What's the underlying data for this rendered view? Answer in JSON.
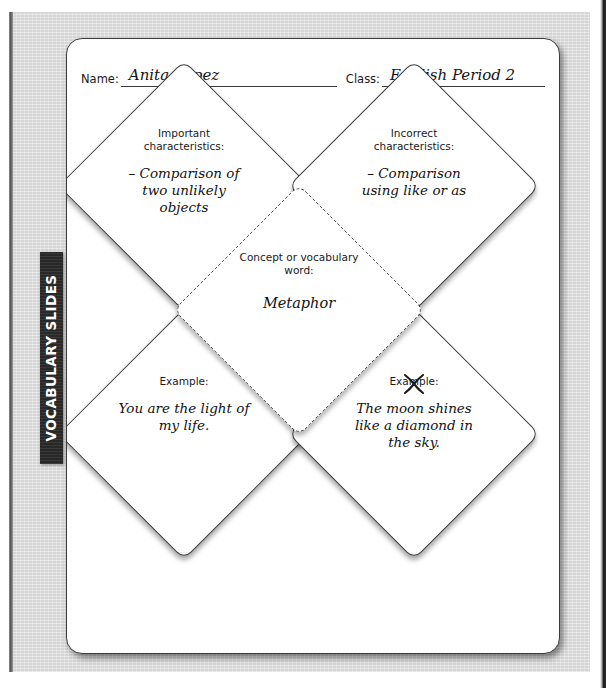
{
  "sidebar": {
    "tab_label": "VOCABULARY SLIDES"
  },
  "header": {
    "name_label": "Name:",
    "name_value": "Anita Lopez",
    "class_label": "Class:",
    "class_value": "English Period 2"
  },
  "diamonds": {
    "top_left": {
      "title": "Important characteristics:",
      "body": "– Comparison of two unlikely objects"
    },
    "top_right": {
      "title": "Incorrect characteristics:",
      "body": "– Comparison using like or as"
    },
    "center": {
      "title": "Concept or vocabulary word:",
      "body": "Metaphor"
    },
    "bottom_left": {
      "title": "Example:",
      "body": "You are the light of my life."
    },
    "bottom_right": {
      "title": "Example:",
      "body": "The moon shines like a diamond in the sky.",
      "marked_out": true
    }
  },
  "colors": {
    "tab_background": "#2e2e2e",
    "tab_text": "#ffffff",
    "page_background": "#dcdcdc",
    "card_background": "#ffffff",
    "ink": "#121212",
    "outline": "#3d3d3d"
  }
}
